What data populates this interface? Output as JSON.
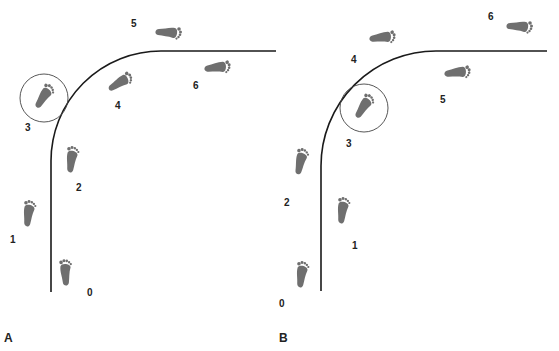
{
  "figure": {
    "panels": [
      {
        "id": "A",
        "label": "A",
        "circled_step": "3",
        "steps": [
          {
            "label": "0",
            "x": 66,
            "y": 273,
            "rot": -5,
            "lx": 87,
            "ly": 293
          },
          {
            "label": "1",
            "x": 29,
            "y": 214,
            "rot": 5,
            "lx": 10,
            "ly": 240
          },
          {
            "label": "2",
            "x": 72,
            "y": 160,
            "rot": 5,
            "lx": 76,
            "ly": 188
          },
          {
            "label": "3",
            "x": 44,
            "y": 97,
            "rot": 30,
            "lx": 25,
            "ly": 128
          },
          {
            "label": "4",
            "x": 120,
            "y": 83,
            "rot": 55,
            "lx": 115,
            "ly": 106
          },
          {
            "label": "5",
            "x": 168,
            "y": 33,
            "rot": 90,
            "lx": 131,
            "ly": 24
          },
          {
            "label": "6",
            "x": 217,
            "y": 68,
            "rot": 80,
            "lx": 193,
            "ly": 86
          }
        ],
        "path": {
          "x0": 51,
          "y0": 292,
          "corner_r": 110,
          "top_y": 51,
          "x1": 276
        }
      },
      {
        "id": "B",
        "label": "B",
        "circled_step": "3",
        "steps": [
          {
            "label": "0",
            "x": 302,
            "y": 275,
            "rot": 5,
            "lx": 279,
            "ly": 304
          },
          {
            "label": "1",
            "x": 343,
            "y": 211,
            "rot": 5,
            "lx": 352,
            "ly": 246
          },
          {
            "label": "2",
            "x": 301,
            "y": 162,
            "rot": 10,
            "lx": 284,
            "ly": 203
          },
          {
            "label": "3",
            "x": 364,
            "y": 107,
            "rot": 30,
            "lx": 346,
            "ly": 144
          },
          {
            "label": "4",
            "x": 382,
            "y": 38,
            "rot": 80,
            "lx": 351,
            "ly": 60
          },
          {
            "label": "5",
            "x": 457,
            "y": 73,
            "rot": 80,
            "lx": 440,
            "ly": 100
          },
          {
            "label": "6",
            "x": 519,
            "y": 27,
            "rot": 90,
            "lx": 488,
            "ly": 17
          }
        ],
        "path": {
          "x0": 321,
          "y0": 291,
          "corner_r": 115,
          "top_y": 51,
          "x1": 547
        }
      }
    ]
  }
}
